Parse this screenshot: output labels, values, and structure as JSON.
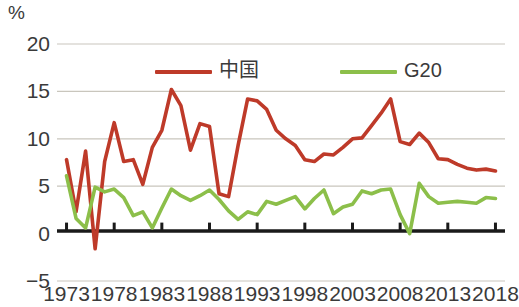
{
  "chart_data": {
    "type": "line",
    "title": "",
    "subtitle": "",
    "xlabel": "",
    "ylabel": "%",
    "unit_label": "%",
    "xlim": [
      1972,
      2019
    ],
    "ylim": [
      -5,
      20
    ],
    "ytick_labels": [
      "20",
      "15",
      "10",
      "5",
      "0",
      "−5"
    ],
    "ytick_values": [
      20,
      15,
      10,
      5,
      0,
      -5
    ],
    "xtick_labels": [
      "1973",
      "1978",
      "1983",
      "1988",
      "1993",
      "1998",
      "2003",
      "2008",
      "2013",
      "2018"
    ],
    "xtick_values": [
      1973,
      1978,
      1983,
      1988,
      1993,
      1998,
      2003,
      2008,
      2013,
      2018
    ],
    "grid": "horizontal",
    "legend_position": "top-center",
    "x": [
      1973,
      1974,
      1975,
      1976,
      1977,
      1978,
      1979,
      1980,
      1981,
      1982,
      1983,
      1984,
      1985,
      1986,
      1987,
      1988,
      1989,
      1990,
      1991,
      1992,
      1993,
      1994,
      1995,
      1996,
      1997,
      1998,
      1999,
      2000,
      2001,
      2002,
      2003,
      2004,
      2005,
      2006,
      2007,
      2008,
      2009,
      2010,
      2011,
      2012,
      2013,
      2014,
      2015,
      2016,
      2017,
      2018
    ],
    "series": [
      {
        "name": "中国",
        "color": "#BE3A29",
        "values": [
          7.8,
          2.3,
          8.7,
          -1.6,
          7.6,
          11.7,
          7.6,
          7.8,
          5.2,
          9.1,
          10.9,
          15.2,
          13.5,
          8.8,
          11.6,
          11.3,
          4.2,
          3.9,
          9.3,
          14.2,
          14.0,
          13.1,
          10.9,
          10.0,
          9.3,
          7.8,
          7.6,
          8.4,
          8.3,
          9.1,
          10.0,
          10.1,
          11.4,
          12.7,
          14.2,
          9.7,
          9.4,
          10.6,
          9.6,
          7.9,
          7.8,
          7.3,
          6.9,
          6.7,
          6.8,
          6.6
        ]
      },
      {
        "name": "G20",
        "color": "#8CBF4A",
        "values": [
          6.1,
          1.6,
          0.6,
          4.9,
          4.4,
          4.7,
          3.8,
          1.9,
          2.3,
          0.6,
          2.7,
          4.7,
          4.0,
          3.5,
          4.0,
          4.6,
          3.6,
          2.4,
          1.5,
          2.3,
          2.0,
          3.4,
          3.1,
          3.5,
          3.9,
          2.6,
          3.7,
          4.6,
          2.1,
          2.8,
          3.1,
          4.5,
          4.2,
          4.6,
          4.7,
          2.0,
          0.0,
          5.3,
          3.9,
          3.2,
          3.3,
          3.4,
          3.3,
          3.2,
          3.8,
          3.7
        ]
      }
    ]
  },
  "legend": {
    "items": [
      {
        "label": "中国",
        "color": "#BE3A29"
      },
      {
        "label": "G20",
        "color": "#8CBF4A"
      }
    ]
  },
  "axis": {
    "unit": "%",
    "y_labels": [
      "20",
      "15",
      "10",
      "5",
      "0",
      "−5"
    ],
    "x_labels": [
      "1973",
      "1978",
      "1983",
      "1988",
      "1993",
      "1998",
      "2003",
      "2008",
      "2013",
      "2018"
    ]
  },
  "colors": {
    "china_line": "#BE3A29",
    "g20_line": "#8CBF4A",
    "gridline": "#C9C6BD",
    "baseline": "#1a1a1a",
    "text": "#3a3a3a",
    "background": "#ffffff"
  }
}
